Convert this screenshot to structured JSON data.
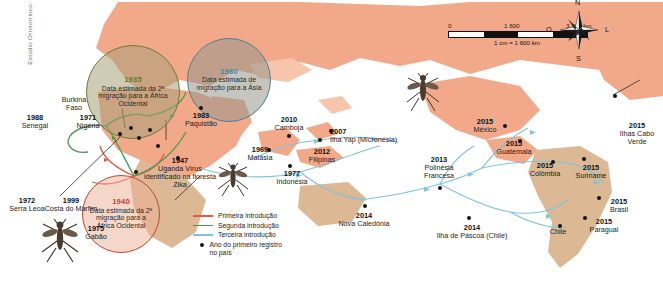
{
  "credit": "Estúdio Ornitorrinco",
  "top_title_fragment": "",
  "bubbles": [
    {
      "id": "green",
      "year": "1935",
      "text": "Data estimada da 2ª migração para a África Ocidental",
      "color": "#5e7d2a"
    },
    {
      "id": "blue",
      "year": "1960",
      "text": "Data estimada de migração para a Ásia",
      "color": "#3f86a8"
    },
    {
      "id": "red",
      "year": "1940",
      "text": "Data estimada da 2ª migração para a África Ocidental",
      "color": "#c6402b"
    }
  ],
  "origin_note": {
    "year": "1947",
    "text": "Uganda Vírus identificado na floresta Zika"
  },
  "points": [
    {
      "year": "1988",
      "name": "Senegal"
    },
    {
      "year": "1972",
      "name": "Serra Leoa"
    },
    {
      "year": "1999",
      "name": "Costa do Marfim"
    },
    {
      "year": "1975",
      "name": "Gabão"
    },
    {
      "year": "1971",
      "name": "Nigéria"
    },
    {
      "year": "",
      "name": "Burkina Faso"
    },
    {
      "year": "1983",
      "name": "Paquistão"
    },
    {
      "year": "1969",
      "name": "Malásia"
    },
    {
      "year": "1977",
      "name": "Indonésia"
    },
    {
      "year": "2010",
      "name": "Camboja"
    },
    {
      "year": "2012",
      "name": "Filipinas"
    },
    {
      "year": "2007",
      "name": "Ilha Yap (Micronésia)"
    },
    {
      "year": "2014",
      "name": "Nova Caledônia"
    },
    {
      "year": "2013",
      "name": "Polinésia Francesa"
    },
    {
      "year": "2014",
      "name": "Ilha de Páscoa (Chile)"
    },
    {
      "year": "2015",
      "name": "México"
    },
    {
      "year": "2015",
      "name": "Guatemala"
    },
    {
      "year": "2015",
      "name": "Colômbia"
    },
    {
      "year": "2015",
      "name": "Suriname"
    },
    {
      "year": "2015",
      "name": "Brasil"
    },
    {
      "year": "2015",
      "name": "Paraguai"
    },
    {
      "year": "",
      "name": "Chile"
    },
    {
      "year": "2015",
      "name": "Ilhas Cabo Verde"
    }
  ],
  "legend": {
    "items": [
      {
        "label": "Primeira introdução",
        "color": "#e8564a",
        "type": "line"
      },
      {
        "label": "Segunda introdução",
        "color": "#4a9b53",
        "type": "line"
      },
      {
        "label": "Terceira introdução",
        "color": "#7fc3e0",
        "type": "line"
      },
      {
        "label": "Ano do primeiro registro no país",
        "type": "dot",
        "color": "#141414"
      }
    ]
  },
  "scale": {
    "ticks": [
      "0",
      "1 600",
      "3 200 km"
    ],
    "equivalence": "1 cm = 1 600 km"
  },
  "compass": {
    "north": "N",
    "south": "S",
    "east": "L",
    "west": "O"
  },
  "colors": {
    "land": "#f2a98a",
    "south_land": "#dcb894",
    "first_intro": "#e8564a",
    "second_intro": "#4a9b53",
    "third_intro": "#7fc3e0"
  }
}
